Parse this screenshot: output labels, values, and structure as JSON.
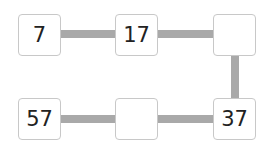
{
  "diagram": {
    "boxes": [
      {
        "id": "top-left",
        "value": "7"
      },
      {
        "id": "top-middle",
        "value": "17"
      },
      {
        "id": "top-right",
        "value": ""
      },
      {
        "id": "bottom-right",
        "value": "37"
      },
      {
        "id": "bottom-middle",
        "value": ""
      },
      {
        "id": "bottom-left",
        "value": "57"
      }
    ],
    "connector_color": "#a9a9a9",
    "box_border_color": "#c8c8c8"
  }
}
